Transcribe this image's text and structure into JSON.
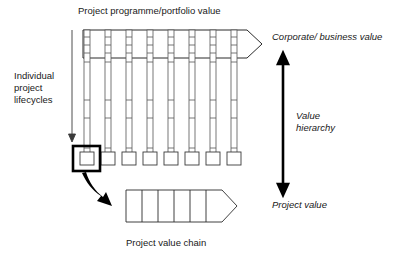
{
  "diagram": {
    "title_top": "Project programme/portfolio value",
    "caption_bottom": "Project value chain",
    "label_left": "Individual\nproject\nlifecycles",
    "label_top_right": "Corporate/ business value",
    "label_mid_right": "Value\nhierarchy",
    "label_bottom_right": "Project value",
    "colors": {
      "stroke": "#2b2b2b",
      "column_stroke": "#555555",
      "highlight": "#000000",
      "background": "#ffffff"
    },
    "lifecycle_columns": {
      "count": 8,
      "ticks_per_column": 7,
      "highlighted_index": 1
    },
    "value_chain": {
      "segments": 6
    },
    "icons": {
      "down_arrow": "down-arrow-icon",
      "curved_arrow": "curved-arrow-icon",
      "double_arrow": "vertical-double-arrow-icon",
      "chain_arrowhead": "arrowhead-icon"
    }
  }
}
